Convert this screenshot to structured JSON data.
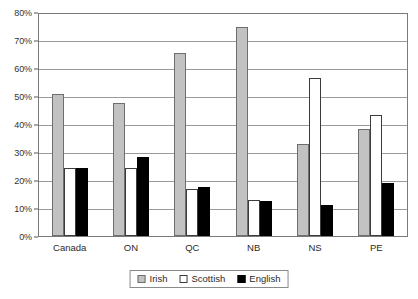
{
  "chart_data": {
    "type": "bar",
    "title": "",
    "xlabel": "",
    "ylabel": "",
    "categories": [
      "Canada",
      "ON",
      "QC",
      "NB",
      "NS",
      "PE"
    ],
    "series": [
      {
        "name": "Irish",
        "color": "#c2c2c2",
        "values": [
          51,
          48,
          66,
          75.5,
          33,
          38.5
        ]
      },
      {
        "name": "Scottish",
        "color": "#ffffff",
        "values": [
          24.5,
          24.5,
          17,
          13,
          57,
          43.5
        ]
      },
      {
        "name": "English",
        "color": "#000000",
        "values": [
          24.5,
          28.5,
          17.5,
          12.5,
          11,
          19
        ]
      }
    ],
    "ylim": [
      0,
      80
    ],
    "ytick_step": 10,
    "ytick_labels": [
      "0%",
      "10%",
      "20%",
      "30%",
      "40%",
      "50%",
      "60%",
      "70%",
      "80%"
    ],
    "ytick_values": [
      0,
      10,
      20,
      30,
      40,
      50,
      60,
      70,
      80
    ],
    "grid": true,
    "grid_axis": "y",
    "legend_position": "bottom",
    "value_suffix": "%"
  }
}
